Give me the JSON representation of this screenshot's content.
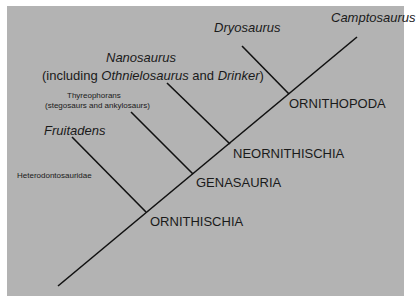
{
  "diagram": {
    "type": "cladogram",
    "background_color": "#b3b3b3",
    "line_color": "#111111",
    "taxa": {
      "camptosaurus": "Camptosaurus",
      "dryosaurus": "Dryosaurus",
      "nanosaurus": "Nanosaurus",
      "nanosaurus_note_prefix": "(including ",
      "nanosaurus_note_othnielosaurus": "Othnielosaurus",
      "nanosaurus_note_and": " and ",
      "nanosaurus_note_drinker": "Drinker",
      "nanosaurus_note_suffix": ")",
      "thyreophorans": "Thyreophorans",
      "thyreophorans_note": "(stegosaurs and ankylosaurs)",
      "fruitadens": "Fruitadens",
      "heterodontosauridae": "Heterodontosauridae"
    },
    "clades": {
      "ornithopoda": "ORNITHOPODA",
      "neornithischia": "NEORNITHISCHIA",
      "genasauria": "GENASAURIA",
      "ornithischia": "ORNITHISCHIA"
    }
  }
}
